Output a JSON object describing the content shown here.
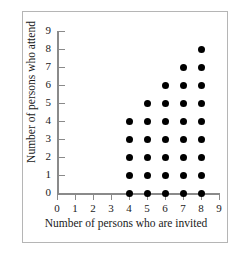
{
  "chart_data": {
    "type": "scatter",
    "title": "",
    "xlabel": "Number of persons who are invited",
    "ylabel": "Number of persons who attend",
    "xlim": [
      0,
      9
    ],
    "ylim": [
      0,
      9
    ],
    "xticks": [
      0,
      1,
      2,
      3,
      4,
      5,
      6,
      7,
      8,
      9
    ],
    "yticks": [
      0,
      1,
      2,
      3,
      4,
      5,
      6,
      7,
      8,
      9
    ],
    "xtick_labels": [
      "0",
      "1",
      "2",
      "3",
      "4",
      "5",
      "6",
      "7",
      "8",
      "9"
    ],
    "ytick_labels": [
      "0",
      "1",
      "2",
      "3",
      "4",
      "5",
      "6",
      "7",
      "8",
      "9"
    ],
    "grid": false,
    "legend": false,
    "marker": "filled-circle",
    "marker_color": "#000000",
    "axis_color": "#8a8a8a",
    "points": [
      {
        "x": 4,
        "y": 0
      },
      {
        "x": 4,
        "y": 1
      },
      {
        "x": 4,
        "y": 2
      },
      {
        "x": 4,
        "y": 3
      },
      {
        "x": 4,
        "y": 4
      },
      {
        "x": 5,
        "y": 0
      },
      {
        "x": 5,
        "y": 1
      },
      {
        "x": 5,
        "y": 2
      },
      {
        "x": 5,
        "y": 3
      },
      {
        "x": 5,
        "y": 4
      },
      {
        "x": 5,
        "y": 5
      },
      {
        "x": 6,
        "y": 0
      },
      {
        "x": 6,
        "y": 1
      },
      {
        "x": 6,
        "y": 2
      },
      {
        "x": 6,
        "y": 3
      },
      {
        "x": 6,
        "y": 4
      },
      {
        "x": 6,
        "y": 5
      },
      {
        "x": 6,
        "y": 6
      },
      {
        "x": 7,
        "y": 0
      },
      {
        "x": 7,
        "y": 1
      },
      {
        "x": 7,
        "y": 2
      },
      {
        "x": 7,
        "y": 3
      },
      {
        "x": 7,
        "y": 4
      },
      {
        "x": 7,
        "y": 5
      },
      {
        "x": 7,
        "y": 6
      },
      {
        "x": 7,
        "y": 7
      },
      {
        "x": 8,
        "y": 0
      },
      {
        "x": 8,
        "y": 1
      },
      {
        "x": 8,
        "y": 2
      },
      {
        "x": 8,
        "y": 3
      },
      {
        "x": 8,
        "y": 4
      },
      {
        "x": 8,
        "y": 5
      },
      {
        "x": 8,
        "y": 6
      },
      {
        "x": 8,
        "y": 7
      },
      {
        "x": 8,
        "y": 8
      }
    ]
  }
}
